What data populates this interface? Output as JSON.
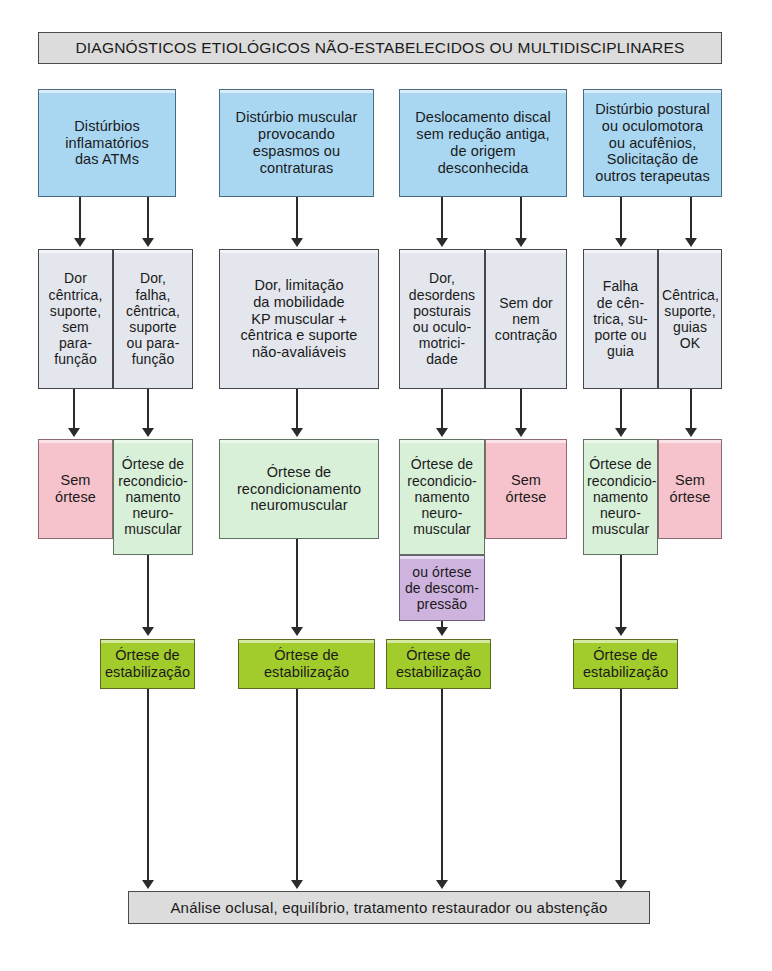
{
  "diagram": {
    "header": "DIAGNÓSTICOS ETIOLÓGICOS NÃO-ESTABELECIDOS OU MULTIDISCIPLINARES",
    "footer": "Análise oclusal, equilíbrio, tratamento restaurador ou abstenção",
    "colors": {
      "header_bg": "#dcdcdc",
      "diagnosis_blue": "#a9d7f2",
      "finding_grayblue": "#e3e6ec",
      "no_orthosis_pink": "#f6c3cc",
      "reconditioning_mint": "#d8efd8",
      "decompression_purple": "#ceb3de",
      "stabilization_olive": "#a2cc2b",
      "line": "#2b2b2b"
    },
    "columns": [
      {
        "diagnosis": "Distúrbios\ninflamatórios\ndas ATMs",
        "findings": [
          "Dor\ncêntrica,\nsuporte,\nsem\npara-\nfunção",
          "Dor,\nfalha,\ncêntrica,\nsuporte\nou para-\nfunção"
        ],
        "treatments": [
          "Sem\nórtese",
          "Órtese de\nrecondicio-\nnamento\nneuro-\nmuscular"
        ],
        "extra": null,
        "stabilization": "Órtese de\nestabilização"
      },
      {
        "diagnosis": "Distúrbio muscular\nprovocando\nespasmos ou\ncontraturas",
        "findings": [
          "Dor, limitação\nda mobilidade\nKP muscular +\ncêntrica e suporte\nnão-avaliáveis"
        ],
        "treatments": [
          "Órtese de\nrecondicionamento\nneuromuscular"
        ],
        "extra": null,
        "stabilization": "Órtese de\nestabilização"
      },
      {
        "diagnosis": "Deslocamento discal\nsem redução antiga,\nde origem\ndesconhecida",
        "findings": [
          "Dor,\ndesordens\nposturais\nou oculo-\nmotrici-\ndade",
          "Sem dor\nnem\ncontração"
        ],
        "treatments": [
          "Órtese de\nrecondicio-\nnamento\nneuro-\nmuscular",
          "Sem\nórtese"
        ],
        "extra": "ou órtese\nde descom-\npressão",
        "stabilization": "Órtese de\nestabilização"
      },
      {
        "diagnosis": "Distúrbio postural\nou oculomotora\nou acufênios,\nSolicitação de\noutros terapeutas",
        "findings": [
          "Falha\nde cên-\ntrica, su-\nporte ou\nguia",
          "Cêntrica,\nsuporte,\nguias OK"
        ],
        "treatments": [
          "Órtese de\nrecondicio-\nnamento\nneuro-\nmuscular",
          "Sem\nórtese"
        ],
        "extra": null,
        "stabilization": "Órtese de\nestabilização"
      }
    ]
  }
}
